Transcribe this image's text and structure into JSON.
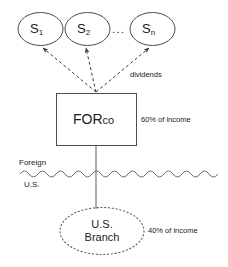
{
  "diagram": {
    "colors": {
      "stroke": "#4d4d4d",
      "text": "#1a1a1a",
      "background": "#ffffff"
    },
    "subsidiaries": [
      {
        "id": "s1",
        "base": "S",
        "subscript": "1"
      },
      {
        "id": "s2",
        "base": "S",
        "subscript": "2"
      },
      {
        "id": "sn",
        "base": "S",
        "subscript": "n"
      }
    ],
    "ellipsis": "...",
    "dividends_label": "dividends",
    "parent": {
      "name_main": "FOR",
      "name_suffix": "co",
      "income_label": "60% of income"
    },
    "border": {
      "above_label": "Foreign",
      "below_label": "U.S."
    },
    "branch": {
      "line1": "U.S.",
      "line2": "Branch",
      "income_label": "40% of income"
    }
  }
}
